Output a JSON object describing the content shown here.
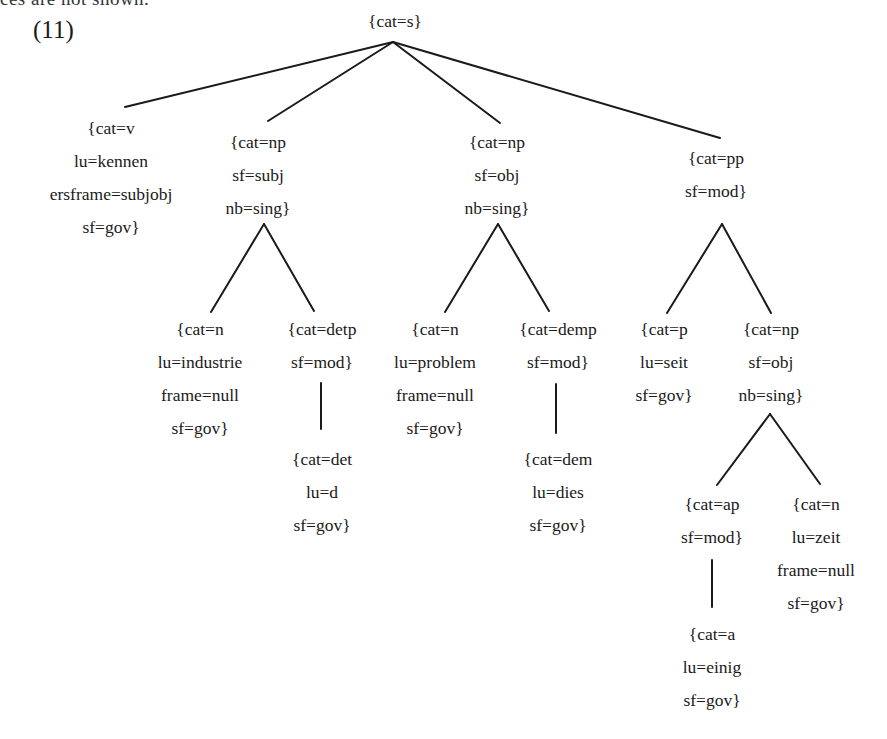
{
  "header": {
    "clipped_text": "ces are not shown.",
    "example_label": "(11)"
  },
  "tree": {
    "root": {
      "lines": [
        "{cat=s}"
      ]
    },
    "v": {
      "lines": [
        "{cat=v",
        "lu=kennen",
        "ersframe=subjobj",
        "sf=gov}"
      ]
    },
    "np_subj": {
      "lines": [
        "{cat=np",
        "sf=subj",
        "nb=sing}"
      ]
    },
    "np_obj": {
      "lines": [
        "{cat=np",
        "sf=obj",
        "nb=sing}"
      ]
    },
    "pp": {
      "lines": [
        "{cat=pp",
        "sf=mod}"
      ]
    },
    "n_industrie": {
      "lines": [
        "{cat=n",
        "lu=industrie",
        "frame=null",
        "sf=gov}"
      ]
    },
    "detp": {
      "lines": [
        "{cat=detp",
        "sf=mod}"
      ]
    },
    "det": {
      "lines": [
        "{cat=det",
        "lu=d",
        "sf=gov}"
      ]
    },
    "n_problem": {
      "lines": [
        "{cat=n",
        "lu=problem",
        "frame=null",
        "sf=gov}"
      ]
    },
    "demp": {
      "lines": [
        "{cat=demp",
        "sf=mod}"
      ]
    },
    "dem": {
      "lines": [
        "{cat=dem",
        "lu=dies",
        "sf=gov}"
      ]
    },
    "p": {
      "lines": [
        "{cat=p",
        "lu=seit",
        "sf=gov}"
      ]
    },
    "np_pp": {
      "lines": [
        "{cat=np",
        "sf=obj",
        "nb=sing}"
      ]
    },
    "ap": {
      "lines": [
        "{cat=ap",
        "sf=mod}"
      ]
    },
    "a": {
      "lines": [
        "{cat=a",
        "lu=einig",
        "sf=gov}"
      ]
    },
    "n_zeit": {
      "lines": [
        "{cat=n",
        "lu=zeit",
        "frame=null",
        "sf=gov}"
      ]
    }
  }
}
